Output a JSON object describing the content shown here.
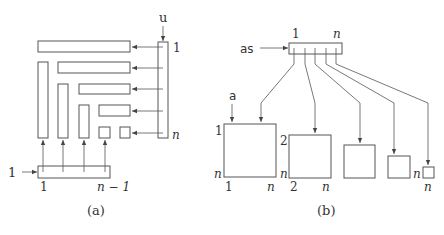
{
  "panel_a": {
    "caption": "(a)",
    "vector_u": {
      "label": "u",
      "top_index": "1",
      "bottom_index": "n"
    },
    "vector_bottom": {
      "arrow_label": "1",
      "left_index": "1",
      "right_index": "n − 1"
    }
  },
  "panel_b": {
    "caption": "(b)",
    "array_as": {
      "label": "as",
      "left_index": "1",
      "right_index": "n"
    },
    "matrix_a_label": "a",
    "matrices": [
      {
        "row_start": "1",
        "row_end": "n",
        "col_start": "1",
        "col_end": "n"
      },
      {
        "row_start": "2",
        "row_end": "n",
        "col_start": "2",
        "col_end": "n"
      },
      {
        "row_start": "",
        "row_end": "",
        "col_start": "",
        "col_end": ""
      },
      {
        "row_start": "",
        "row_end": "n",
        "col_start": "",
        "col_end": ""
      },
      {
        "row_start": "",
        "row_end": "",
        "col_start": "",
        "col_end": "n"
      }
    ]
  }
}
